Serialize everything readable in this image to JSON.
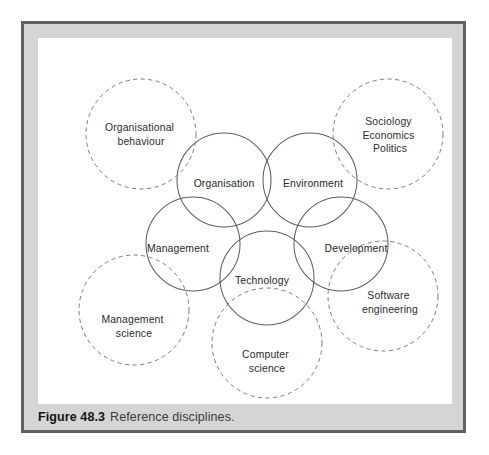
{
  "figure": {
    "caption_number": "Figure 48.3",
    "caption_text": "Reference disciplines.",
    "frame_color": "#5f6163",
    "panel_color": "#ffffff",
    "mat_color": "#d5d5d5"
  },
  "diagram": {
    "type": "venn-overlapping-circles",
    "core_stroke_color": "#5d5f63",
    "reference_stroke_color": "#7b7d81",
    "core_disciplines": [
      {
        "id": "organisation",
        "label": "Organisation",
        "cx": 186,
        "cy": 142,
        "r": 47,
        "label_x": 186,
        "label_y": 146
      },
      {
        "id": "environment",
        "label": "Environment",
        "cx": 272,
        "cy": 142,
        "r": 47,
        "label_x": 275,
        "label_y": 146
      },
      {
        "id": "management",
        "label": "Management",
        "cx": 155,
        "cy": 206,
        "r": 47,
        "label_x": 140,
        "label_y": 211
      },
      {
        "id": "development",
        "label": "Development",
        "cx": 303,
        "cy": 206,
        "r": 47,
        "label_x": 318,
        "label_y": 211
      },
      {
        "id": "technology",
        "label": "Technology",
        "cx": 229,
        "cy": 240,
        "r": 47,
        "label_x": 224,
        "label_y": 243
      }
    ],
    "reference_disciplines": [
      {
        "id": "organisational-behaviour",
        "lines": [
          "Organisational",
          "behaviour"
        ],
        "cx": 103,
        "cy": 96,
        "r": 55,
        "label_x": 103,
        "label_y": 90
      },
      {
        "id": "sociology-economics-politics",
        "lines": [
          "Sociology",
          "Economics",
          "Politics"
        ],
        "cx": 350,
        "cy": 96,
        "r": 55,
        "label_x": 352,
        "label_y": 84
      },
      {
        "id": "management-science",
        "lines": [
          "Management",
          "science"
        ],
        "cx": 96,
        "cy": 272,
        "r": 55,
        "label_x": 96,
        "label_y": 282
      },
      {
        "id": "software-engineering",
        "lines": [
          "Software",
          "engineering"
        ],
        "cx": 345,
        "cy": 258,
        "r": 55,
        "label_x": 352,
        "label_y": 258
      },
      {
        "id": "computer-science",
        "lines": [
          "Computer",
          "science"
        ],
        "cx": 229,
        "cy": 305,
        "r": 55,
        "label_x": 229,
        "label_y": 317
      }
    ]
  }
}
